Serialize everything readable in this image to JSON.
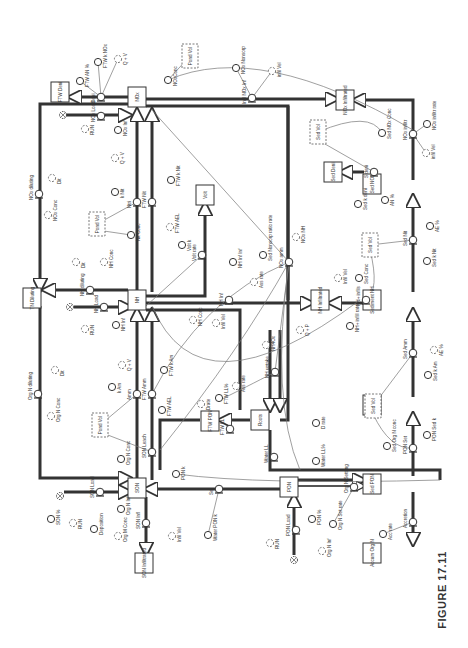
{
  "figure": {
    "caption": "FIGURE 17.11",
    "orientation": "rotated 90° counter-clockwise",
    "type": "stock-and-flow diagram (nitrogen model)"
  },
  "stocks": [
    {
      "id": "nox",
      "label": "NOx",
      "x": 137,
      "y": 97
    },
    {
      "id": "nh",
      "label": "NH",
      "x": 137,
      "y": 300
    },
    {
      "id": "son",
      "label": "SON",
      "x": 137,
      "y": 488
    },
    {
      "id": "ftw_deni",
      "label": "FTW Deni",
      "x": 60,
      "y": 92
    },
    {
      "id": "nox_infiltrated",
      "label": "NOx Infiltrated",
      "x": 345,
      "y": 100
    },
    {
      "id": "sed_nox",
      "label": "Sed NOx",
      "x": 372,
      "y": 184
    },
    {
      "id": "sed_deni",
      "label": "Sed Deni",
      "x": 333,
      "y": 172
    },
    {
      "id": "volt",
      "label": "Volt",
      "x": 205,
      "y": 195
    },
    {
      "id": "tn_diluting",
      "label": "TN Diluting",
      "x": 32,
      "y": 298
    },
    {
      "id": "nh_infiltrated",
      "label": "NH Infiltrated",
      "x": 320,
      "y": 300
    },
    {
      "id": "sediment_nh",
      "label": "Sediment NH",
      "x": 372,
      "y": 300
    },
    {
      "id": "sed_son",
      "label": "Sed SON",
      "x": 372,
      "y": 405
    },
    {
      "id": "sed_pon",
      "label": "Sed PON",
      "x": 372,
      "y": 484
    },
    {
      "id": "ftw_pon",
      "label": "FTW PON",
      "x": 210,
      "y": 421
    },
    {
      "id": "roots",
      "label": "Roots",
      "x": 260,
      "y": 420
    },
    {
      "id": "pon",
      "label": "PON",
      "x": 289,
      "y": 487
    },
    {
      "id": "son_infiltrated",
      "label": "SON Infiltrated",
      "x": 144,
      "y": 563
    },
    {
      "id": "accum_org_n",
      "label": "Accum Org N",
      "x": 372,
      "y": 553
    }
  ],
  "flows": [
    {
      "id": "deni",
      "label": "Deni",
      "x": 101,
      "y": 97
    },
    {
      "id": "nox_load",
      "label": "NOx Load",
      "x": 101,
      "y": 116
    },
    {
      "id": "ntri",
      "label": "Ntri",
      "x": 137,
      "y": 202
    },
    {
      "id": "ftw_nit",
      "label": "FTW Nit",
      "x": 152,
      "y": 202
    },
    {
      "id": "nox_diluting",
      "label": "NOx diluting",
      "x": 39,
      "y": 194
    },
    {
      "id": "nh_diluting",
      "label": "NH diluting",
      "x": 90,
      "y": 290
    },
    {
      "id": "nh_load",
      "label": "NH Load",
      "x": 104,
      "y": 307
    },
    {
      "id": "volt_rate",
      "label": "Volt rate",
      "x": 202,
      "y": 255
    },
    {
      "id": "nh_inf",
      "label": "NH Inf",
      "x": 229,
      "y": 300
    },
    {
      "id": "nox_amm",
      "label": "NOx amm",
      "x": 289,
      "y": 262
    },
    {
      "id": "infil_nox_inf",
      "label": "Infil NOx Inf",
      "x": 252,
      "y": 98
    },
    {
      "id": "nox_infil",
      "label": "NOx infiltr",
      "x": 413,
      "y": 134
    },
    {
      "id": "s_deni",
      "label": "S deni",
      "x": 374,
      "y": 172
    },
    {
      "id": "sed_nit",
      "label": "Sed Nit",
      "x": 413,
      "y": 240
    },
    {
      "id": "nh_infil",
      "label": "NH+ infils",
      "x": 366,
      "y": 300
    },
    {
      "id": "sed_amm",
      "label": "Sed Amm",
      "x": 413,
      "y": 353
    },
    {
      "id": "org_n_diluting",
      "label": "Org N diluting",
      "x": 38,
      "y": 394
    },
    {
      "id": "amm",
      "label": "Amm",
      "x": 137,
      "y": 394
    },
    {
      "id": "ftw_amm",
      "label": "FTW Amm",
      "x": 152,
      "y": 394
    },
    {
      "id": "son_leach",
      "label": "SON Leach",
      "x": 152,
      "y": 452
    },
    {
      "id": "son_load",
      "label": "SON Load",
      "x": 100,
      "y": 492
    },
    {
      "id": "son_infl",
      "label": "SON Infl",
      "x": 146,
      "y": 523
    },
    {
      "id": "nh_uptake",
      "label": "NH uptake",
      "x": 275,
      "y": 372
    },
    {
      "id": "ftw_ll",
      "label": "FTW LL",
      "x": 230,
      "y": 429
    },
    {
      "id": "water_ll",
      "label": "Water LL",
      "x": 274,
      "y": 457
    },
    {
      "id": "set",
      "label": "Set",
      "x": 219,
      "y": 489
    },
    {
      "id": "org_n_settling",
      "label": "Org N Settling",
      "x": 354,
      "y": 487
    },
    {
      "id": "pon_load",
      "label": "PON Load",
      "x": 296,
      "y": 530
    },
    {
      "id": "pon_set",
      "label": "PON Set",
      "x": 413,
      "y": 448
    },
    {
      "id": "accretion",
      "label": "Accretion",
      "x": 413,
      "y": 522
    }
  ],
  "converters": [
    {
      "label": "FTW AN %",
      "x": 80,
      "y": 81,
      "ghost": false
    },
    {
      "label": "FTW k NOx",
      "x": 98,
      "y": 62,
      "ghost": false
    },
    {
      "label": "Q + V",
      "x": 118,
      "y": 59,
      "ghost": true
    },
    {
      "label": "NOxConc",
      "x": 168,
      "y": 80,
      "ghost": false
    },
    {
      "label": "NOx Nonsorp",
      "x": 236,
      "y": 68,
      "ghost": false
    },
    {
      "label": "infil Vel",
      "x": 272,
      "y": 71,
      "ghost": true
    },
    {
      "label": "RUN",
      "x": 85,
      "y": 129,
      "ghost": true
    },
    {
      "label": "NOx Inf",
      "x": 118,
      "y": 130,
      "ghost": false
    },
    {
      "label": "Q + V",
      "x": 115,
      "y": 158,
      "ghost": true
    },
    {
      "label": "k Nit",
      "x": 115,
      "y": 192,
      "ghost": false
    },
    {
      "label": "FTW k Nit",
      "x": 171,
      "y": 180,
      "ghost": false
    },
    {
      "label": "FTW AEL",
      "x": 170,
      "y": 227,
      "ghost": true
    },
    {
      "label": "Nit Conc",
      "x": 131,
      "y": 235,
      "ghost": false
    },
    {
      "label": "Dit",
      "x": 52,
      "y": 178,
      "ghost": true
    },
    {
      "label": "NOx Conc",
      "x": 48,
      "y": 215,
      "ghost": true
    },
    {
      "label": "Volt k",
      "x": 182,
      "y": 245,
      "ghost": false
    },
    {
      "label": "Dit",
      "x": 76,
      "y": 262,
      "ghost": true
    },
    {
      "label": "NH Conc",
      "x": 104,
      "y": 262,
      "ghost": true
    },
    {
      "label": "RUN",
      "x": 85,
      "y": 329,
      "ghost": true
    },
    {
      "label": "NH Inf",
      "x": 116,
      "y": 325,
      "ghost": false
    },
    {
      "label": "NH Conc",
      "x": 193,
      "y": 320,
      "ghost": true
    },
    {
      "label": "Infil Vel",
      "x": 216,
      "y": 323,
      "ghost": true
    },
    {
      "label": "NH Inf Inf",
      "x": 233,
      "y": 262,
      "ghost": false
    },
    {
      "label": "Sed Nonsorp ratio rate",
      "x": 263,
      "y": 255,
      "ghost": false
    },
    {
      "label": "NOx NH",
      "x": 296,
      "y": 237,
      "ghost": true
    },
    {
      "label": "Q + P",
      "x": 300,
      "y": 330,
      "ghost": true
    },
    {
      "label": "NH4Ox",
      "x": 266,
      "y": 345,
      "ghost": true
    },
    {
      "label": "Ass rate",
      "x": 254,
      "y": 282,
      "ghost": true
    },
    {
      "label": "Sed Conc",
      "x": 359,
      "y": 278,
      "ghost": false
    },
    {
      "label": "Infil Vel",
      "x": 338,
      "y": 278,
      "ghost": true
    },
    {
      "label": "NH+ infill rate",
      "x": 350,
      "y": 326,
      "ghost": false
    },
    {
      "label": "Sed NOx Conc",
      "x": 382,
      "y": 133,
      "ghost": false
    },
    {
      "label": "NOx infiltr rate",
      "x": 427,
      "y": 124,
      "ghost": false
    },
    {
      "label": "infil Vel",
      "x": 426,
      "y": 153,
      "ghost": true
    },
    {
      "label": "Sed k deni",
      "x": 358,
      "y": 204,
      "ghost": false
    },
    {
      "label": "AN %",
      "x": 385,
      "y": 200,
      "ghost": false
    },
    {
      "label": "AE %",
      "x": 430,
      "y": 226,
      "ghost": false
    },
    {
      "label": "Sed k Nit",
      "x": 427,
      "y": 261,
      "ghost": false
    },
    {
      "label": "AE %",
      "x": 434,
      "y": 350,
      "ghost": true
    },
    {
      "label": "Sed k Am",
      "x": 428,
      "y": 375,
      "ghost": false
    },
    {
      "label": "Q + V",
      "x": 122,
      "y": 365,
      "ghost": true
    },
    {
      "label": "k Am",
      "x": 112,
      "y": 387,
      "ghost": false
    },
    {
      "label": "FTW k Am",
      "x": 164,
      "y": 370,
      "ghost": false
    },
    {
      "label": "FTW AEL",
      "x": 162,
      "y": 410,
      "ghost": false
    },
    {
      "label": "Dit",
      "x": 55,
      "y": 370,
      "ghost": true
    },
    {
      "label": "Org N Conc",
      "x": 51,
      "y": 416,
      "ghost": true
    },
    {
      "label": "Org N Conc",
      "x": 121,
      "y": 459,
      "ghost": false
    },
    {
      "label": "PON k",
      "x": 176,
      "y": 474,
      "ghost": false
    },
    {
      "label": "Drate",
      "x": 201,
      "y": 404,
      "ghost": true
    },
    {
      "label": "FTW LL%",
      "x": 219,
      "y": 398,
      "ghost": false
    },
    {
      "label": "Ass rate",
      "x": 236,
      "y": 386,
      "ghost": true
    },
    {
      "label": "D rate",
      "x": 316,
      "y": 423,
      "ghost": false
    },
    {
      "label": "Water LL%",
      "x": 316,
      "y": 461,
      "ghost": false
    },
    {
      "label": "SON %",
      "x": 51,
      "y": 519,
      "ghost": false
    },
    {
      "label": "RUN",
      "x": 73,
      "y": 523,
      "ghost": true
    },
    {
      "label": "Deposition",
      "x": 94,
      "y": 529,
      "ghost": false
    },
    {
      "label": "Org N Inf",
      "x": 121,
      "y": 509,
      "ghost": false
    },
    {
      "label": "Org M Conc",
      "x": 118,
      "y": 536,
      "ghost": true
    },
    {
      "label": "Infil Vel",
      "x": 172,
      "y": 536,
      "ghost": true
    },
    {
      "label": "Water PON k",
      "x": 208,
      "y": 535,
      "ghost": false
    },
    {
      "label": "PON %",
      "x": 312,
      "y": 519,
      "ghost": false
    },
    {
      "label": "Org N Set rate",
      "x": 333,
      "y": 524,
      "ghost": false
    },
    {
      "label": "RUN",
      "x": 270,
      "y": 543,
      "ghost": true
    },
    {
      "label": "Org N Inf",
      "x": 322,
      "y": 551,
      "ghost": true
    },
    {
      "label": "PON Sed k",
      "x": 427,
      "y": 435,
      "ghost": false
    },
    {
      "label": "Sed Org N conc",
      "x": 387,
      "y": 446,
      "ghost": false
    },
    {
      "label": "Acc rate",
      "x": 383,
      "y": 534,
      "ghost": false
    }
  ],
  "ghost_stocks": [
    {
      "label": "Pond Vol",
      "x": 190,
      "y": 56
    },
    {
      "label": "Pond Vol",
      "x": 97,
      "y": 224
    },
    {
      "label": "Pond Vol",
      "x": 100,
      "y": 425
    },
    {
      "label": "Sed Vol",
      "x": 318,
      "y": 132
    },
    {
      "label": "Sed Vol",
      "x": 370,
      "y": 245
    },
    {
      "label": "Sed Vol",
      "x": 373,
      "y": 406
    }
  ],
  "clouds": [
    {
      "label": "source-nox-load",
      "x": 63,
      "y": 115
    },
    {
      "label": "source-nh-load",
      "x": 70,
      "y": 307
    },
    {
      "label": "source-son-load",
      "x": 60,
      "y": 496
    },
    {
      "label": "source-pon-load",
      "x": 294,
      "y": 560
    }
  ]
}
